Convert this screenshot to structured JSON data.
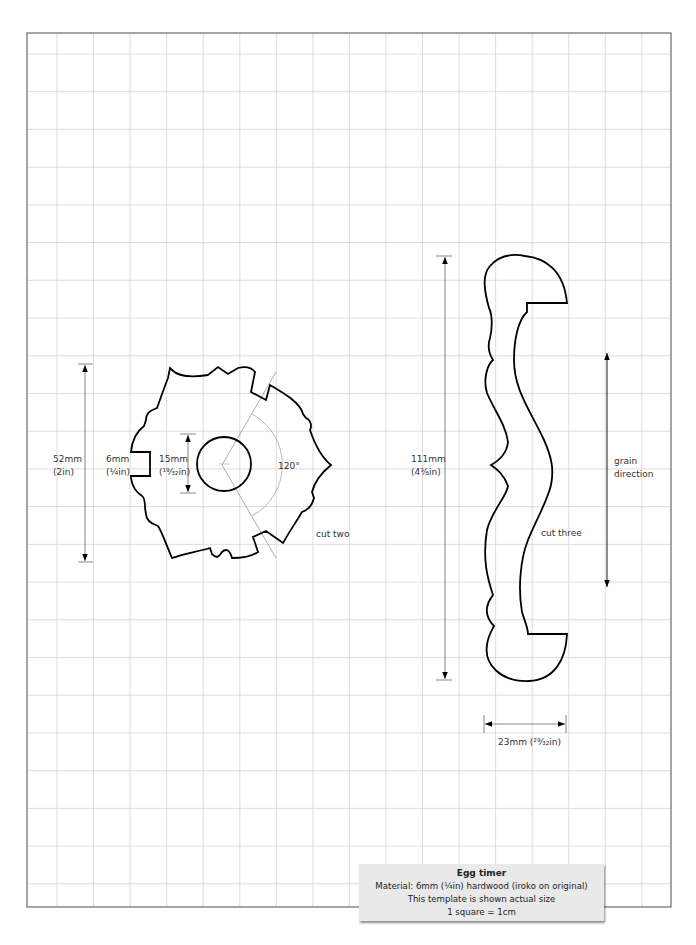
{
  "template": {
    "title": "Egg timer",
    "material": "Material:  6mm (¼in) hardwood (iroko on original)",
    "scale_note": "This template is shown actual size",
    "grid_note": "1 square = 1cm",
    "grid_unit": "1cm"
  },
  "gear_piece": {
    "quantity_label": "cut two",
    "overall_height": {
      "mm": "52mm",
      "in": "(2in)"
    },
    "slot_width": {
      "mm": "6mm",
      "in": "(¼in)"
    },
    "hole_diameter": {
      "mm": "15mm",
      "in": "(¹⁹⁄₃₂in)"
    },
    "slot_angle": "120°"
  },
  "upright_piece": {
    "quantity_label": "cut three",
    "overall_height": {
      "mm": "111mm",
      "in": "(4⅜in)"
    },
    "width": {
      "label": "23mm (²⁹⁄₃₂in)"
    },
    "grain": {
      "line1": "grain",
      "line2": "direction"
    }
  },
  "colors": {
    "grid_line": "#d4d4d4",
    "frame": "#6a6a6a",
    "outline": "#000000",
    "dimension": "#555555",
    "caption_bg": "#e9e9e9"
  }
}
